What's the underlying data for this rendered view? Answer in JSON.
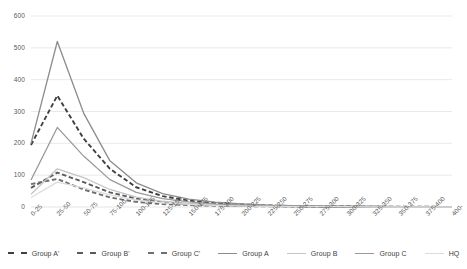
{
  "chart_data": {
    "type": "line",
    "title": "",
    "subtitle": "",
    "xlabel": "",
    "ylabel": "",
    "ylim": [
      0,
      600
    ],
    "yticks": [
      0,
      100,
      200,
      300,
      400,
      500,
      600
    ],
    "ytick_labels": [
      "0",
      "100",
      "200",
      "300",
      "400",
      "500",
      "600"
    ],
    "grid": true,
    "grid_axis": "y",
    "legend_position": "bottom",
    "categories": [
      "0-25",
      "25-50",
      "50-75",
      "75-100",
      "100-125",
      "125-150",
      "150-175",
      "175-200",
      "200-225",
      "225-250",
      "250-275",
      "275-300",
      "300-325",
      "325-350",
      "350-375",
      "375-400",
      "400-"
    ],
    "series": [
      {
        "name": "Group A'",
        "style": "dashed",
        "color": "#3f3f3f",
        "values": [
          195,
          350,
          215,
          120,
          62,
          34,
          20,
          12,
          8,
          5,
          3,
          2,
          2,
          1,
          1,
          1,
          0
        ]
      },
      {
        "name": "Group B'",
        "style": "dashed",
        "color": "#5a5a5a",
        "values": [
          60,
          108,
          78,
          46,
          26,
          15,
          9,
          6,
          4,
          3,
          2,
          1,
          1,
          1,
          0,
          0,
          0
        ]
      },
      {
        "name": "Group C'",
        "style": "dashed",
        "color": "#6e6e6e",
        "values": [
          72,
          88,
          55,
          30,
          16,
          9,
          6,
          4,
          3,
          2,
          1,
          1,
          1,
          0,
          0,
          0,
          0
        ]
      },
      {
        "name": "Group A",
        "style": "solid",
        "color": "#8c8c8c",
        "values": [
          200,
          520,
          295,
          145,
          76,
          42,
          25,
          15,
          10,
          6,
          4,
          3,
          2,
          2,
          1,
          1,
          0
        ]
      },
      {
        "name": "Group B",
        "style": "solid",
        "color": "#c4c4c4",
        "values": [
          40,
          120,
          92,
          55,
          31,
          18,
          11,
          7,
          5,
          3,
          2,
          2,
          1,
          1,
          0,
          0,
          0
        ]
      },
      {
        "name": "Group C",
        "style": "solid",
        "color": "#9a9a9a",
        "values": [
          85,
          250,
          160,
          86,
          46,
          26,
          16,
          10,
          6,
          4,
          3,
          2,
          1,
          1,
          1,
          0,
          0
        ]
      },
      {
        "name": "HQ",
        "style": "solid",
        "color": "#dcdcdc",
        "values": [
          30,
          78,
          60,
          38,
          22,
          13,
          8,
          5,
          3,
          2,
          1,
          1,
          1,
          0,
          0,
          0,
          0
        ]
      }
    ]
  },
  "legend": {
    "items": [
      {
        "label": "Group A'",
        "color": "#3f3f3f",
        "style": "dashed"
      },
      {
        "label": "Group B'",
        "color": "#5a5a5a",
        "style": "dashed"
      },
      {
        "label": "Group C'",
        "color": "#6e6e6e",
        "style": "dashed"
      },
      {
        "label": "Group A",
        "color": "#8c8c8c",
        "style": "solid"
      },
      {
        "label": "Group B",
        "color": "#c4c4c4",
        "style": "solid"
      },
      {
        "label": "Group C",
        "color": "#9a9a9a",
        "style": "solid"
      },
      {
        "label": "HQ",
        "color": "#dcdcdc",
        "style": "solid"
      }
    ]
  },
  "style": {
    "grid_color": "#e6e6e6",
    "tick_text_color": "#5a5a5a",
    "legend_text_color": "#3d3d3d",
    "background": "#ffffff"
  }
}
